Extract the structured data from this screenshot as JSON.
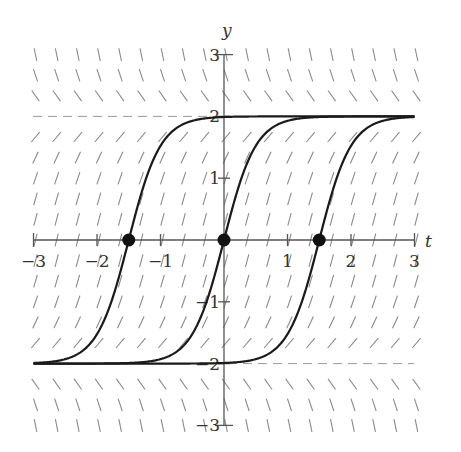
{
  "chart_data": {
    "type": "slope_field",
    "title": "",
    "equation_implied": "dy/dt = 4 - y^2",
    "xlabel": "t",
    "ylabel": "y",
    "xlim": [
      -3,
      3
    ],
    "ylim": [
      -3,
      3
    ],
    "x_ticks": [
      -3,
      -2,
      -1,
      1,
      2,
      3
    ],
    "x_tick_labels": [
      "−3",
      "−2",
      "−1",
      "1",
      "2",
      "3"
    ],
    "y_ticks": [
      3,
      2,
      1,
      -1,
      -2,
      -3
    ],
    "y_tick_labels": [
      "3",
      "2",
      "1",
      "−1",
      "−2",
      "−3"
    ],
    "grid": false,
    "equilibria": [
      {
        "y": 2,
        "style": "dashed"
      },
      {
        "y": -2,
        "style": "dashed"
      }
    ],
    "solution_curves": [
      {
        "name": "solution-through-t-minus-1.5",
        "formula": "y = 2 tanh(2(t + 1.5))",
        "shift": -1.5
      },
      {
        "name": "solution-through-t-0",
        "formula": "y = 2 tanh(2t)",
        "shift": 0
      },
      {
        "name": "solution-through-t-1.5",
        "formula": "y = 2 tanh(2(t - 1.5))",
        "shift": 1.5
      }
    ],
    "marked_points": [
      {
        "t": -1.5,
        "y": 0
      },
      {
        "t": 0,
        "y": 0
      },
      {
        "t": 1.5,
        "y": 0
      }
    ],
    "slope_field": {
      "t_step": 0.3333,
      "y_step": 0.3333,
      "segment_length": 0.22
    }
  },
  "colors": {
    "axis": "#555555",
    "curve": "#1a1a1a",
    "slope": "#8a8a8a",
    "dashed": "#9a9a9a",
    "dot": "#111111"
  },
  "layout": {
    "x0_px": 224,
    "y0_px": 240,
    "px_per_t": 63.5,
    "px_per_y": 61.8
  }
}
